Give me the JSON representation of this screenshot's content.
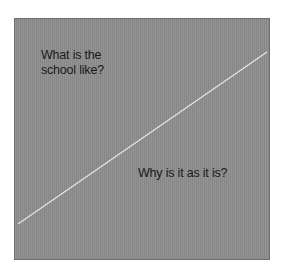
{
  "diagram": {
    "background_color": "#8c8c8c",
    "line_color": "#e6e6e6",
    "upper_region": {
      "line1": "What is the",
      "line2": "school like?"
    },
    "lower_region": {
      "text": "Why is it as it is?"
    },
    "divider": {
      "from": [
        18,
        224
      ],
      "to": [
        267,
        52
      ]
    }
  }
}
